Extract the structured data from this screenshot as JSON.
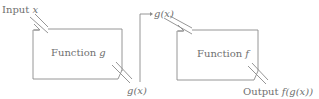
{
  "diagram": {
    "type": "function-composition",
    "colors": {
      "stroke": "#8a8a8a",
      "text": "#707070",
      "background": "#ffffff"
    },
    "input_label": {
      "prefix": "Input ",
      "var": "x"
    },
    "box_g": {
      "prefix": "Function ",
      "name": "g"
    },
    "g_output_label": "g(x)",
    "g_input_label": "g(x)",
    "box_f": {
      "prefix": "Function ",
      "name": "f"
    },
    "output_label": {
      "prefix": "Output ",
      "expr": "f(g(x))"
    }
  }
}
